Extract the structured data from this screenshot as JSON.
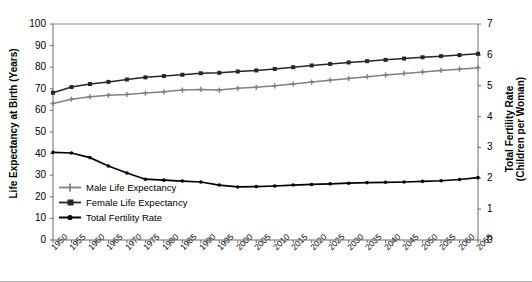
{
  "chart_data": {
    "type": "line",
    "title": "",
    "xlabel": "",
    "ylabel": "Life Expectancy at Birth (Years)",
    "y2label": "Total Fertility Rate\n(Children per Woman)",
    "grid": false,
    "legend_position": "lower-left-inside",
    "x": [
      1950,
      1955,
      1960,
      1965,
      1970,
      1975,
      1980,
      1985,
      1990,
      1995,
      2000,
      2005,
      2010,
      2015,
      2020,
      2025,
      2030,
      2035,
      2040,
      2045,
      2050,
      2055,
      2060,
      2065
    ],
    "xtick_labels": [
      "1950",
      "1955",
      "1960",
      "1965",
      "1970",
      "1975",
      "1980",
      "1985",
      "1990",
      "1995",
      "2000",
      "2005",
      "2010",
      "2015",
      "2020",
      "2025",
      "2030",
      "2035",
      "2040",
      "2045",
      "2050",
      "2055",
      "2060",
      "2065"
    ],
    "ylim": [
      0,
      100
    ],
    "ytick_labels": [
      "0",
      "10",
      "20",
      "30",
      "40",
      "50",
      "60",
      "70",
      "80",
      "90",
      "100"
    ],
    "yticks": [
      0,
      10,
      20,
      30,
      40,
      50,
      60,
      70,
      80,
      90,
      100
    ],
    "y2lim": [
      0,
      7
    ],
    "y2tick_labels": [
      "0",
      "1",
      "2",
      "3",
      "4",
      "5",
      "6",
      "7"
    ],
    "y2ticks": [
      0,
      1,
      2,
      3,
      4,
      5,
      6,
      7
    ],
    "series": [
      {
        "name": "Male Life Expectancy",
        "axis": "left",
        "color": "#808080",
        "marker": "plus",
        "values": [
          63.2,
          65.2,
          66.3,
          67.0,
          67.4,
          68.0,
          68.6,
          69.4,
          69.7,
          69.4,
          70.2,
          70.7,
          71.4,
          72.2,
          73.1,
          74.0,
          74.8,
          75.6,
          76.4,
          77.1,
          77.8,
          78.5,
          79.1,
          79.8
        ]
      },
      {
        "name": "Female Life Expectancy",
        "axis": "left",
        "color": "#262626",
        "marker": "square",
        "values": [
          68.2,
          70.8,
          72.2,
          73.2,
          74.3,
          75.3,
          75.9,
          76.5,
          77.2,
          77.4,
          78.0,
          78.5,
          79.2,
          80.0,
          80.8,
          81.5,
          82.2,
          82.8,
          83.4,
          84.0,
          84.6,
          85.1,
          85.6,
          86.2
        ]
      },
      {
        "name": "Total Fertility Rate",
        "axis": "right",
        "color": "#000000",
        "marker": "dot",
        "values": [
          2.84,
          2.82,
          2.67,
          2.4,
          2.17,
          1.97,
          1.94,
          1.91,
          1.88,
          1.78,
          1.72,
          1.73,
          1.75,
          1.78,
          1.8,
          1.82,
          1.84,
          1.86,
          1.87,
          1.88,
          1.9,
          1.92,
          1.96,
          2.02
        ]
      }
    ]
  },
  "legend": {
    "items": [
      {
        "label": "Male Life Expectancy",
        "color": "#808080",
        "marker": "plus"
      },
      {
        "label": "Female Life Expectancy",
        "color": "#262626",
        "marker": "square"
      },
      {
        "label": "Total Fertility Rate",
        "color": "#000000",
        "marker": "dot"
      }
    ]
  },
  "axes": {
    "left_title": "Life Expectancy at Birth (Years)",
    "right_title_line1": "Total Fertility Rate",
    "right_title_line2": "(Children per Woman)"
  }
}
